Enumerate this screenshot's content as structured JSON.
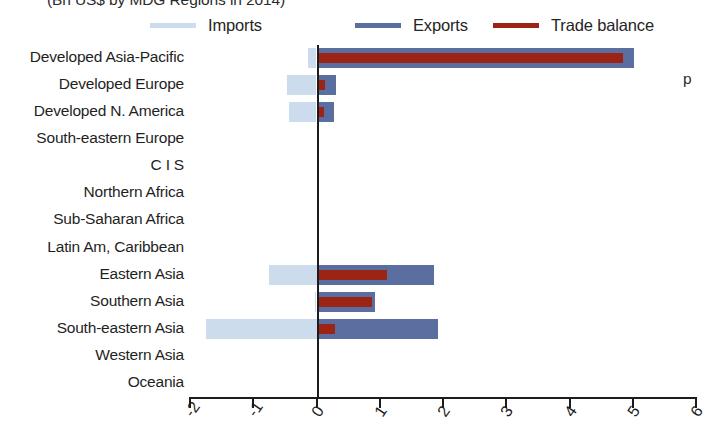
{
  "chart_data": {
    "type": "bar",
    "orientation": "horizontal",
    "title": "(Bn US$ by MDG Regions in 2014)",
    "xlabel": "",
    "ylabel": "",
    "xlim": [
      -2,
      6
    ],
    "xticks": [
      "-2",
      "-1",
      "0",
      "1",
      "2",
      "3",
      "4",
      "5",
      "6"
    ],
    "xtick_values": [
      -2,
      -1,
      0,
      1,
      2,
      3,
      4,
      5,
      6
    ],
    "grid": false,
    "legend_position": "top",
    "categories": [
      "Developed Asia-Pacific",
      "Developed Europe",
      "Developed N. America",
      "South-eastern Europe",
      "C I S",
      "Northern Africa",
      "Sub-Saharan Africa",
      "Latin Am, Caribbean",
      "Eastern Asia",
      "Southern Asia",
      "South-eastern Asia",
      "Western Asia",
      "Oceania"
    ],
    "series": [
      {
        "name": "Imports",
        "color": "#ccdcec",
        "values": [
          -0.13,
          -0.47,
          -0.44,
          0,
          0,
          0,
          0,
          0,
          -0.75,
          -0.03,
          -1.75,
          0,
          0
        ]
      },
      {
        "name": "Exports",
        "color": "#5b6ea0",
        "values": [
          5.02,
          0.31,
          0.28,
          0,
          0,
          0,
          0,
          0,
          1.85,
          0.92,
          1.92,
          0,
          0
        ]
      },
      {
        "name": "Trade balance",
        "color": "#9c2415",
        "values": [
          4.85,
          0.13,
          0.12,
          0,
          0,
          0,
          0,
          0,
          1.12,
          0.88,
          0.3,
          0,
          0
        ]
      }
    ]
  },
  "legend": {
    "items": [
      {
        "label": "Imports",
        "color": "#ccdcec"
      },
      {
        "label": "Exports",
        "color": "#5b6ea0"
      },
      {
        "label": "Trade balance",
        "color": "#9c2415"
      }
    ]
  },
  "edge_clip_text": "p"
}
